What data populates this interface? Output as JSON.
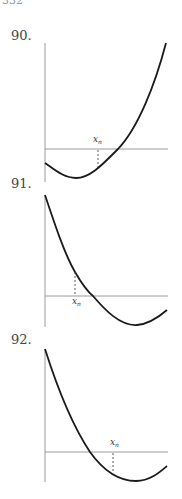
{
  "page": {
    "number_fragment": "332"
  },
  "problems": [
    {
      "label": "90.",
      "point_label": "x",
      "point_subscript": "n"
    },
    {
      "label": "91.",
      "point_label": "x",
      "point_subscript": "n"
    },
    {
      "label": "92.",
      "point_label": "x",
      "point_subscript": "n"
    }
  ],
  "colors": {
    "axis": "#9a9a9a",
    "curve": "#1a1a1a",
    "text": "#444444"
  }
}
